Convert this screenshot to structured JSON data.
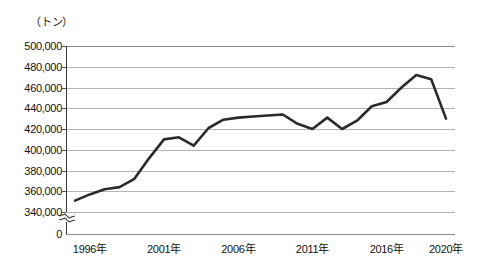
{
  "chart_data": {
    "type": "line",
    "title": "",
    "subtitle": "",
    "unit_label": "（トン）",
    "xlabel": "",
    "ylabel": "",
    "ylim": [
      330000,
      500000
    ],
    "y_ticks": [
      {
        "value": 500000,
        "label": "500,000"
      },
      {
        "value": 480000,
        "label": "480,000"
      },
      {
        "value": 460000,
        "label": "460,000"
      },
      {
        "value": 440000,
        "label": "440,000"
      },
      {
        "value": 420000,
        "label": "420,000"
      },
      {
        "value": 400000,
        "label": "400,000"
      },
      {
        "value": 380000,
        "label": "380,000"
      },
      {
        "value": 360000,
        "label": "360,000"
      },
      {
        "value": 340000,
        "label": "340,000"
      },
      {
        "value": 0,
        "label": "0"
      }
    ],
    "axis_break": true,
    "grid": true,
    "legend": "none",
    "x_tick_labels": [
      {
        "x": 1996,
        "label": "1996年"
      },
      {
        "x": 2001,
        "label": "2001年"
      },
      {
        "x": 2006,
        "label": "2006年"
      },
      {
        "x": 2011,
        "label": "2011年"
      },
      {
        "x": 2016,
        "label": "2016年"
      },
      {
        "x": 2020,
        "label": "2020年"
      }
    ],
    "xlim": [
      1995,
      2020
    ],
    "x": [
      1995,
      1996,
      1997,
      1998,
      1999,
      2000,
      2001,
      2002,
      2003,
      2004,
      2005,
      2006,
      2007,
      2008,
      2009,
      2010,
      2011,
      2012,
      2013,
      2014,
      2015,
      2016,
      2017,
      2018,
      2019,
      2020
    ],
    "series": [
      {
        "name": "数量",
        "color": "#2b2b2b",
        "values": [
          351000,
          357000,
          362000,
          364000,
          372000,
          392000,
          410000,
          412000,
          404000,
          421000,
          429000,
          431000,
          432000,
          433000,
          434000,
          425000,
          420000,
          431000,
          420000,
          428000,
          442000,
          446000,
          460000,
          472000,
          468000,
          430000
        ]
      }
    ]
  }
}
